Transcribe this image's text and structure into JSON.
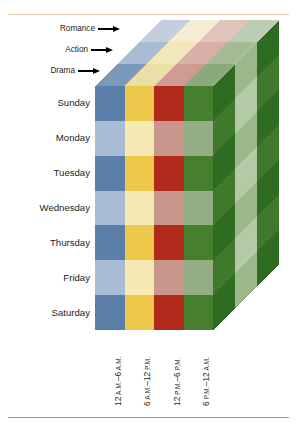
{
  "figure": {
    "type": "3d-heatmap-cube",
    "geometry": {
      "front_face_left_x": 95,
      "front_face_top_y": 86,
      "front_face_width": 118,
      "front_face_height": 244,
      "skew_dx": 66,
      "skew_dy": -66
    }
  },
  "genres": {
    "axis_name": "Genre",
    "items": [
      {
        "label": "Romance",
        "order": 3
      },
      {
        "label": "Action",
        "order": 2
      },
      {
        "label": "Drama",
        "order": 1
      }
    ]
  },
  "days": {
    "axis_name": "Day of week",
    "items": [
      {
        "label": "Sunday"
      },
      {
        "label": "Monday"
      },
      {
        "label": "Tuesday"
      },
      {
        "label": "Wednesday"
      },
      {
        "label": "Thursday"
      },
      {
        "label": "Friday"
      },
      {
        "label": "Saturday"
      }
    ]
  },
  "time_periods": {
    "axis_name": "Time of day",
    "items": [
      {
        "label": "12 A.M.–6 A.M.",
        "num1": "12",
        "mer1": "A.M.",
        "dash": "–",
        "num2": "6",
        "mer2": "A.M."
      },
      {
        "label": "6 A.M.–12 P.M.",
        "num1": "6",
        "mer1": "A.M.",
        "dash": "–",
        "num2": "12",
        "mer2": "P.M."
      },
      {
        "label": "12 P.M.–6 P.M.",
        "num1": "12",
        "mer1": "P.M.",
        "dash": "–",
        "num2": "6",
        "mer2": "P.M."
      },
      {
        "label": "6 P.M.–12 A.M.",
        "num1": "6",
        "mer1": "P.M.",
        "dash": "–",
        "num2": "12",
        "mer2": "A.M."
      }
    ]
  },
  "colors": {
    "blue_dark": "#5b7fa8",
    "blue_light": "#a8bcd6",
    "yellow_dark": "#eec84a",
    "yellow_light": "#f6e9b4",
    "red_dark": "#b12a1c",
    "red_light": "#c9958c",
    "green_dark": "#46802f",
    "green_light": "#93ae84",
    "top_blue_a": "#7e98bc",
    "top_blue_b": "#a9bbd3",
    "top_blue_c": "#c3cfe0",
    "top_yellow_a": "#ecdfa6",
    "top_yellow_b": "#f2e7bb",
    "top_yellow_c": "#f4edd2",
    "top_red_a": "#cf9b92",
    "top_red_b": "#d9b0a7",
    "top_red_c": "#e0c3bb",
    "top_green_a": "#8aa97c",
    "top_green_b": "#a3bc96",
    "top_green_c": "#bccdb1",
    "side_green_a": "#2f6b21",
    "side_green_b": "#3f7a2c",
    "side_green_c": "#9bb88b",
    "side_green_d": "#b4c9a6",
    "rule_top": "#e6c9a8",
    "rule_bottom": "#9a9a9a",
    "arrow": "#000000",
    "text": "#1c1c1c",
    "background": "#ffffff"
  },
  "chart_data": {
    "type": "heatmap",
    "title": "",
    "xlabel": "Time of day",
    "ylabel": "Day of week",
    "zlabel": "Genre",
    "x_categories": [
      "12 A.M.–6 A.M.",
      "6 A.M.–12 P.M.",
      "12 P.M.–6 P.M.",
      "6 P.M.–12 A.M."
    ],
    "y_categories": [
      "Sunday",
      "Monday",
      "Tuesday",
      "Wednesday",
      "Thursday",
      "Friday",
      "Saturday"
    ],
    "z_categories": [
      "Drama",
      "Action",
      "Romance"
    ],
    "legend_position": "none",
    "grid": false,
    "front_face_cells": [
      [
        "blue_dark",
        "yellow_dark",
        "red_dark",
        "green_dark"
      ],
      [
        "blue_light",
        "yellow_light",
        "red_light",
        "green_light"
      ],
      [
        "blue_dark",
        "yellow_dark",
        "red_dark",
        "green_dark"
      ],
      [
        "blue_light",
        "yellow_light",
        "red_light",
        "green_light"
      ],
      [
        "blue_dark",
        "yellow_dark",
        "red_dark",
        "green_dark"
      ],
      [
        "blue_light",
        "yellow_light",
        "red_light",
        "green_light"
      ],
      [
        "blue_dark",
        "yellow_dark",
        "red_dark",
        "green_dark"
      ]
    ],
    "top_face_cells": [
      [
        "top_blue_a",
        "top_yellow_a",
        "top_red_a",
        "top_green_a"
      ],
      [
        "top_blue_b",
        "top_yellow_b",
        "top_red_b",
        "top_green_b"
      ],
      [
        "top_blue_c",
        "top_yellow_c",
        "top_red_c",
        "top_green_c"
      ]
    ],
    "side_face_cells": [
      [
        "side_green_a",
        "side_green_c",
        "side_green_a"
      ],
      [
        "side_green_b",
        "side_green_d",
        "side_green_b"
      ],
      [
        "side_green_a",
        "side_green_c",
        "side_green_a"
      ],
      [
        "side_green_b",
        "side_green_d",
        "side_green_b"
      ],
      [
        "side_green_a",
        "side_green_c",
        "side_green_a"
      ],
      [
        "side_green_b",
        "side_green_d",
        "side_green_b"
      ],
      [
        "side_green_a",
        "side_green_c",
        "side_green_a"
      ]
    ]
  }
}
